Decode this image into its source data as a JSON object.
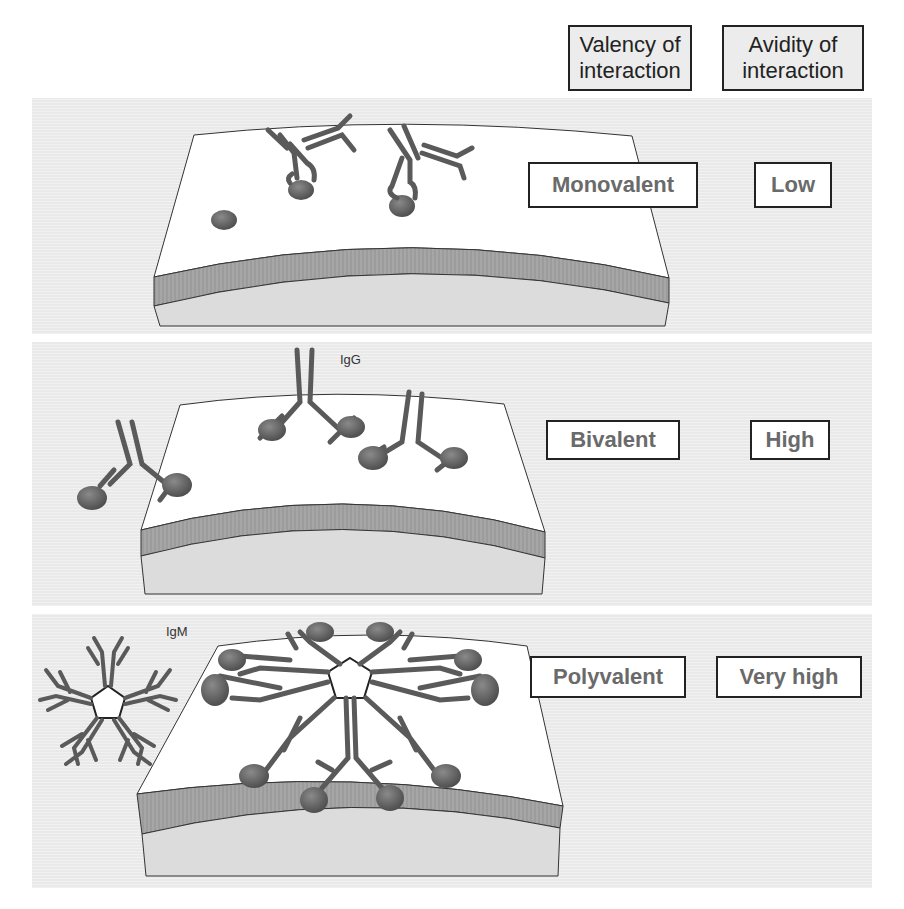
{
  "header": {
    "valency": {
      "line1": "Valency of",
      "line2": "interaction"
    },
    "avidity": {
      "line1": "Avidity of",
      "line2": "interaction"
    }
  },
  "rows": [
    {
      "id": "row-1",
      "valency": "Monovalent",
      "avidity": "Low",
      "antibody_label": ""
    },
    {
      "id": "row-2",
      "valency": "Bivalent",
      "avidity": "High",
      "antibody_label": "IgG"
    },
    {
      "id": "row-3",
      "valency": "Polyvalent",
      "avidity": "Very high",
      "antibody_label": "IgM"
    }
  ],
  "colors": {
    "panel_bg": "#ededed",
    "surface_top": "#ffffff",
    "surface_band": "#9c9c9c",
    "surface_base": "#dcdcdc",
    "antibody": "#5a5a5a",
    "antigen": "#6b6b6b",
    "label_text": "#6a6a6a",
    "border": "#222222"
  }
}
